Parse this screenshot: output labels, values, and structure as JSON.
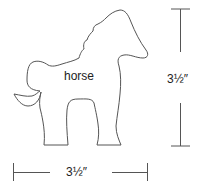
{
  "diagram": {
    "shape_label": "horse",
    "height_dimension": "3½″",
    "width_dimension": "3½″",
    "stroke_color": "#555555"
  }
}
